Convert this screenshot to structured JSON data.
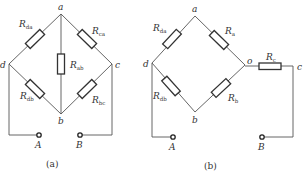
{
  "figure_a": {
    "caption": "(a)",
    "nodes": {
      "a": "a",
      "b": "b",
      "c": "c",
      "d": "d"
    },
    "terminals": {
      "A": "A",
      "B": "B"
    },
    "resistors": {
      "da": {
        "main": "R",
        "sub": "da"
      },
      "ca": {
        "main": "R",
        "sub": "ca"
      },
      "ab": {
        "main": "R",
        "sub": "ab"
      },
      "db": {
        "main": "R",
        "sub": "db"
      },
      "bc": {
        "main": "R",
        "sub": "bc"
      }
    }
  },
  "figure_b": {
    "caption": "(b)",
    "nodes": {
      "a": "a",
      "b": "b",
      "c": "c",
      "d": "d",
      "o": "o"
    },
    "terminals": {
      "A": "A",
      "B": "B"
    },
    "resistors": {
      "da": {
        "main": "R",
        "sub": "da"
      },
      "a": {
        "main": "R",
        "sub": "a"
      },
      "db": {
        "main": "R",
        "sub": "db"
      },
      "b": {
        "main": "R",
        "sub": "b"
      },
      "c": {
        "main": "R",
        "sub": "c"
      }
    }
  },
  "colors": {
    "wire": "#555555",
    "component": "#333333",
    "background": "#ffffff"
  }
}
